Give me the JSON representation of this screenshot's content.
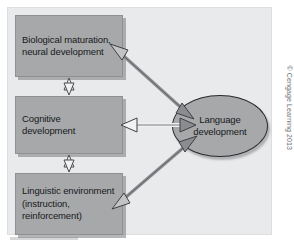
{
  "figure": {
    "panel_background": "#e9eaec",
    "node_fill": "#a6a8aa",
    "arrow_fill": "#8a8c8f",
    "arrow_stroke": "#4a4c4f",
    "nodes": [
      {
        "id": "biological",
        "shape": "rectangle",
        "label": "Biological maturation, neural development"
      },
      {
        "id": "cognitive",
        "shape": "rectangle",
        "label": "Cognitive development"
      },
      {
        "id": "linguistic",
        "shape": "rectangle",
        "label": "Linguistic environment (instruction, reinforcement)"
      },
      {
        "id": "language",
        "shape": "ellipse",
        "label": "Language development"
      }
    ],
    "connections": [
      {
        "from": "biological",
        "to": "cognitive",
        "style": "double-headed-vertical"
      },
      {
        "from": "cognitive",
        "to": "linguistic",
        "style": "double-headed-vertical"
      },
      {
        "from": "biological",
        "to": "language",
        "style": "double-headed-diagonal"
      },
      {
        "from": "cognitive",
        "to": "language",
        "style": "double-headed-horizontal"
      },
      {
        "from": "linguistic",
        "to": "language",
        "style": "double-headed-diagonal"
      }
    ],
    "credit": "© Cengage Learning 2013"
  }
}
